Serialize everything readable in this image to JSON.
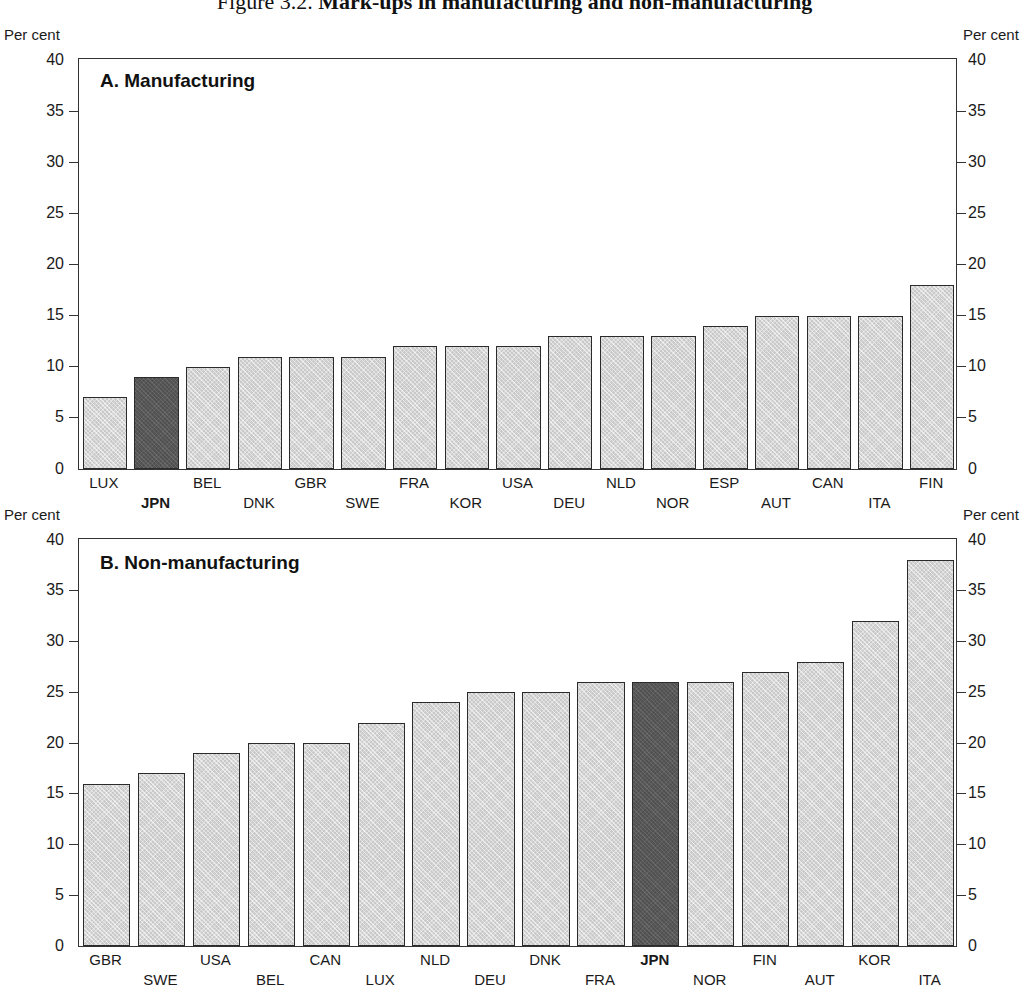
{
  "title": {
    "number": "Figure 3.2.",
    "text": "Mark-ups in manufacturing and non-manufacturing"
  },
  "axis": {
    "unit_label": "Per cent",
    "ticks": [
      "0",
      "5",
      "10",
      "15",
      "20",
      "25",
      "30",
      "35",
      "40"
    ],
    "min": 0,
    "max": 40
  },
  "panels": {
    "a": {
      "caption": "A. Manufacturing"
    },
    "b": {
      "caption": "B. Non-manufacturing"
    }
  },
  "colors": {
    "bar_fill": "#c9c9c9",
    "bar_highlight": "#515151",
    "bar_border": "#2b2b2b",
    "axis": "#333333",
    "text": "#1a1a1a"
  },
  "chart_data": [
    {
      "type": "bar",
      "title": "A. Manufacturing",
      "xlabel": "",
      "ylabel": "Per cent",
      "ylim": [
        0,
        40
      ],
      "yticks": [
        0,
        5,
        10,
        15,
        20,
        25,
        30,
        35,
        40
      ],
      "grid": false,
      "legend": "none",
      "highlight": "JPN",
      "categories": [
        "LUX",
        "JPN",
        "BEL",
        "DNK",
        "GBR",
        "SWE",
        "FRA",
        "KOR",
        "USA",
        "DEU",
        "NLD",
        "NOR",
        "ESP",
        "AUT",
        "CAN",
        "ITA",
        "FIN"
      ],
      "values": [
        7,
        9,
        10,
        11,
        11,
        11,
        12,
        12,
        12,
        13,
        13,
        13,
        14,
        15,
        15,
        15,
        18
      ]
    },
    {
      "type": "bar",
      "title": "B. Non-manufacturing",
      "xlabel": "",
      "ylabel": "Per cent",
      "ylim": [
        0,
        40
      ],
      "yticks": [
        0,
        5,
        10,
        15,
        20,
        25,
        30,
        35,
        40
      ],
      "grid": false,
      "legend": "none",
      "highlight": "JPN",
      "categories": [
        "GBR",
        "SWE",
        "USA",
        "BEL",
        "CAN",
        "LUX",
        "NLD",
        "DEU",
        "DNK",
        "FRA",
        "JPN",
        "NOR",
        "FIN",
        "AUT",
        "KOR",
        "ITA"
      ],
      "values": [
        16,
        17,
        19,
        20,
        20,
        22,
        24,
        25,
        25,
        26,
        26,
        26,
        27,
        28,
        32,
        38
      ]
    }
  ]
}
